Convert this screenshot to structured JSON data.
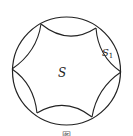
{
  "diagram": {
    "type": "geometry",
    "circle": {
      "cx": 66.5,
      "cy": 71,
      "r": 54
    },
    "vertex_count": 6,
    "labels": {
      "center": "S",
      "segment": "S",
      "segment_subscript": "1"
    },
    "caption": "图"
  },
  "colors": {
    "stroke": "#222222",
    "background": "#ffffff"
  }
}
